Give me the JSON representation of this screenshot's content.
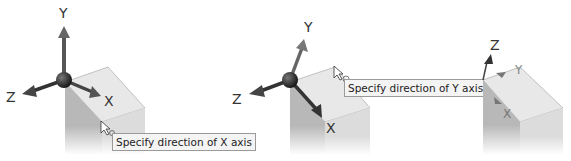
{
  "panels": [
    {
      "step": 1,
      "axis_labels": {
        "x": "X",
        "y": "Y",
        "z": "Z"
      },
      "tooltip": "Specify direction of X axis"
    },
    {
      "step": 2,
      "axis_labels": {
        "x": "X",
        "y": "Y",
        "z": "Z"
      },
      "tooltip": "Specify direction of Y axis"
    },
    {
      "step": 3,
      "axis_labels": {
        "z": "Z",
        "y": "Y",
        "x": "X"
      }
    }
  ],
  "colors": {
    "block_top": "#e6e6e6",
    "block_left": "#bdbdbd",
    "block_right": "#d8d8d8",
    "axis_arrow": "#555555",
    "gizmo_ball": "#2a2a2a",
    "tooltip_bg": "#f4f4f4",
    "tooltip_border": "#9a9a9a"
  }
}
